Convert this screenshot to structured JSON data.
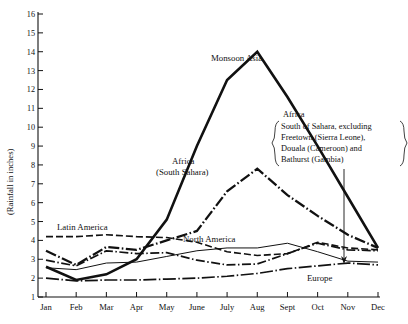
{
  "chart_data": {
    "type": "line",
    "title": "",
    "xlabel": "",
    "ylabel": "(Rainfall in inches)",
    "categories": [
      "Jan",
      "Feb",
      "Mar",
      "Apr",
      "May",
      "June",
      "July",
      "Aug",
      "Sept",
      "Oct",
      "Nov",
      "Dec"
    ],
    "ylim": [
      1,
      16
    ],
    "yticks": [
      "1",
      "2",
      "3",
      "4",
      "5",
      "6",
      "7",
      "8",
      "9",
      "10",
      "11",
      "12",
      "13",
      "14",
      "15",
      "16"
    ],
    "grid": false,
    "legend": "inline-labels",
    "series": [
      {
        "name": "Monsoon Asia",
        "style": "solid-thick",
        "color": "#111111",
        "values": [
          2.6,
          1.9,
          2.2,
          3.0,
          5.1,
          9.0,
          12.5,
          14.0,
          11.6,
          9.0,
          6.3,
          3.6
        ]
      },
      {
        "name": "Africa (South Sahara)",
        "style": "dash-dot-thick",
        "color": "#111111",
        "values": [
          3.45,
          2.7,
          3.65,
          3.5,
          4.0,
          4.5,
          6.6,
          7.8,
          6.4,
          5.3,
          4.3,
          3.6
        ]
      },
      {
        "name": "Latin America",
        "style": "dashed",
        "color": "#111111",
        "values": [
          4.2,
          4.2,
          4.3,
          4.2,
          4.15,
          3.9,
          3.4,
          3.2,
          3.3,
          3.9,
          3.6,
          3.5
        ]
      },
      {
        "name": "North America",
        "style": "solid-thin",
        "color": "#111111",
        "values": [
          2.55,
          2.45,
          2.8,
          2.85,
          3.15,
          3.45,
          3.6,
          3.6,
          3.85,
          3.4,
          2.9,
          2.85
        ]
      },
      {
        "name": "Europe",
        "style": "long-dash-dot",
        "color": "#111111",
        "values": [
          2.0,
          1.85,
          1.9,
          1.9,
          1.95,
          2.0,
          2.1,
          2.25,
          2.5,
          2.65,
          2.8,
          2.7
        ]
      },
      {
        "name": "unlabelled-dashed-lower",
        "style": "dash-dot-medium",
        "color": "#111111",
        "values": [
          2.95,
          2.65,
          3.45,
          3.3,
          3.35,
          2.95,
          2.7,
          2.75,
          3.3,
          3.85,
          3.5,
          3.45
        ]
      }
    ],
    "annotations": [
      {
        "name": "monsoon-asia-label",
        "text": "Monsoon Asia",
        "x": 211,
        "y": 61
      },
      {
        "name": "africa-south-sahara-label-line1",
        "text": "Africa",
        "x": 172,
        "y": 164
      },
      {
        "name": "africa-south-sahara-label-line2",
        "text": "(South Sahara)",
        "x": 156,
        "y": 175
      },
      {
        "name": "latin-america-label",
        "text": "Latin America",
        "x": 57,
        "y": 230
      },
      {
        "name": "north-america-label",
        "text": "North America",
        "x": 183,
        "y": 242
      },
      {
        "name": "europe-label",
        "text": "Europe",
        "x": 307,
        "y": 281
      }
    ],
    "callout": {
      "name": "africa-excluding-note",
      "heading": "Africa",
      "lines": [
        "South of Sahara, excluding",
        "Freetown (Sierra Leone),",
        "Douala (Cameroon) and",
        "Bathurst (Gambia)"
      ],
      "points_to": "Dec"
    }
  }
}
